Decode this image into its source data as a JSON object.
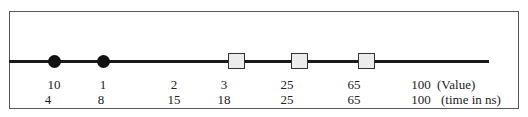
{
  "diagram": {
    "events": [
      {
        "marker": "circle",
        "x": 54,
        "value": "10",
        "time": "4"
      },
      {
        "marker": "circle",
        "x": 103,
        "value": "1",
        "time": "8"
      },
      {
        "marker": "none",
        "x": 174,
        "value": "2",
        "time": "15"
      },
      {
        "marker": "square",
        "x": 224,
        "square_x": 237,
        "value": "3",
        "time": "18"
      },
      {
        "marker": "square",
        "x": 286,
        "square_x": 300,
        "value": "25",
        "time": "25"
      },
      {
        "marker": "square",
        "x": 353,
        "square_x": 367,
        "value": "65",
        "time": "65"
      },
      {
        "marker": "none",
        "x": 420,
        "value": "100",
        "time": "100"
      }
    ],
    "row_labels": {
      "value": "(Value)",
      "time": "(time in ns)"
    },
    "colors": {
      "line": "#1a1a1a",
      "circle": "#111111",
      "square_fill": "#ececec",
      "square_border": "#333333",
      "frame": "#555555"
    }
  }
}
